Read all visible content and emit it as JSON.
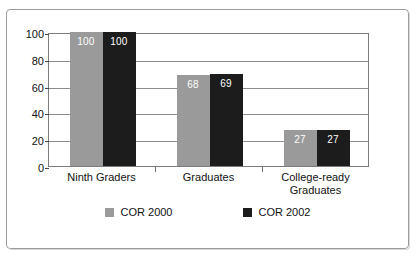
{
  "chart_data": {
    "type": "bar",
    "title": "",
    "subtitle": "",
    "xlabel": "",
    "ylabel": "",
    "grid": true,
    "legend_position": "bottom",
    "ylim": [
      0,
      100
    ],
    "yticks": [
      0,
      20,
      40,
      60,
      80,
      100
    ],
    "ytick_labels": [
      "0",
      "20",
      "40",
      "60",
      "80",
      "100"
    ],
    "categories": [
      "Ninth Graders",
      "Graduates",
      "College-ready Graduates"
    ],
    "category_lines": [
      [
        "Ninth Graders"
      ],
      [
        "Graduates"
      ],
      [
        "College-ready",
        "Graduates"
      ]
    ],
    "series": [
      {
        "name": "COR 2000",
        "color": "#9a9a9a",
        "values": [
          100,
          68,
          27
        ],
        "value_labels": [
          "100",
          "68",
          "27"
        ]
      },
      {
        "name": "COR 2002",
        "color": "#1c1c1c",
        "values": [
          100,
          69,
          27
        ],
        "value_labels": [
          "100",
          "69",
          "27"
        ]
      }
    ]
  },
  "legend": {
    "items": [
      {
        "label": "COR 2000",
        "color": "#9a9a9a"
      },
      {
        "label": "COR 2002",
        "color": "#1c1c1c"
      }
    ]
  }
}
